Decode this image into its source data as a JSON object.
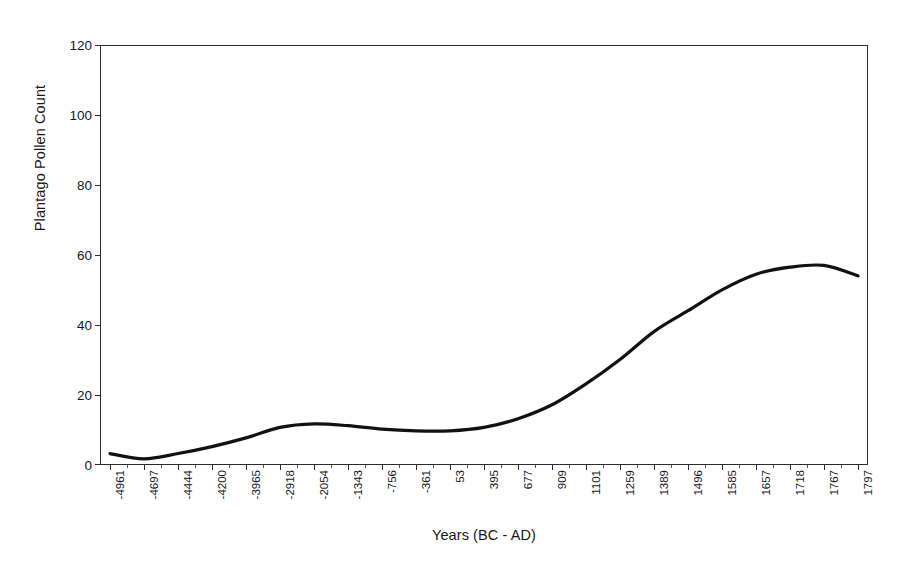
{
  "chart_data": {
    "type": "line",
    "title": "",
    "xlabel": "Years (BC - AD)",
    "ylabel": "Plantago Pollen Count",
    "grid": false,
    "legend": "none",
    "ylim": [
      0,
      120
    ],
    "ytick_labels": [
      "120",
      "100",
      "80",
      "60",
      "40",
      "20",
      "0"
    ],
    "ytick_values": [
      120,
      100,
      80,
      60,
      40,
      20,
      0
    ],
    "categories": [
      "-4961",
      "-4697",
      "-4444",
      "-4200",
      "-3965",
      "-2918",
      "-2054",
      "-1343",
      "-756",
      "-361",
      "53",
      "395",
      "677",
      "909",
      "1101",
      "1259",
      "1389",
      "1496",
      "1585",
      "1657",
      "1718",
      "1767",
      "1797"
    ],
    "values": [
      3,
      1.5,
      3,
      5,
      7.5,
      10.5,
      11.5,
      11,
      10,
      9.5,
      9.5,
      10.5,
      13,
      17,
      23,
      30,
      38,
      44,
      50,
      54.5,
      56.5,
      57,
      54
    ],
    "series": [
      {
        "name": "Plantago Pollen Count",
        "color": "#111111",
        "values": [
          3,
          1.5,
          3,
          5,
          7.5,
          10.5,
          11.5,
          11,
          10,
          9.5,
          9.5,
          10.5,
          13,
          17,
          23,
          30,
          38,
          44,
          50,
          54.5,
          56.5,
          57,
          54
        ]
      }
    ]
  },
  "axes": {
    "frame_color": "#2b2b2b",
    "background": "#ffffff"
  }
}
